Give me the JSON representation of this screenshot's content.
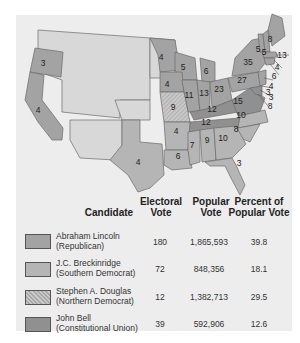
{
  "map": {
    "colors": {
      "lincoln": "#a3a3a3",
      "breckinridge": "#b5b5b5",
      "douglas": "#c2c2c2",
      "bell": "#8f8f8f",
      "territory": "#d8d8d8",
      "water": "#ededed"
    },
    "state_labels": [
      {
        "state": "Oregon",
        "votes": "3"
      },
      {
        "state": "California",
        "votes": "4"
      },
      {
        "state": "Texas",
        "votes": "4"
      },
      {
        "state": "Minnesota",
        "votes": "4"
      },
      {
        "state": "Wisconsin",
        "votes": "5"
      },
      {
        "state": "Michigan",
        "votes": "6"
      },
      {
        "state": "Iowa",
        "votes": "4"
      },
      {
        "state": "Illinois",
        "votes": "11"
      },
      {
        "state": "Indiana",
        "votes": "13"
      },
      {
        "state": "Ohio",
        "votes": "23"
      },
      {
        "state": "Missouri",
        "votes": "9"
      },
      {
        "state": "Kentucky",
        "votes": "12"
      },
      {
        "state": "Tennessee",
        "votes": "12"
      },
      {
        "state": "Virginia",
        "votes": "15"
      },
      {
        "state": "North Carolina",
        "votes": "10"
      },
      {
        "state": "South Carolina",
        "votes": "8"
      },
      {
        "state": "Arkansas",
        "votes": "4"
      },
      {
        "state": "Louisiana",
        "votes": "6"
      },
      {
        "state": "Mississippi",
        "votes": "7"
      },
      {
        "state": "Alabama",
        "votes": "9"
      },
      {
        "state": "Georgia",
        "votes": "10"
      },
      {
        "state": "Florida",
        "votes": "3"
      },
      {
        "state": "Pennsylvania",
        "votes": "27"
      },
      {
        "state": "New York",
        "votes": "35"
      },
      {
        "state": "Vermont",
        "votes": "5"
      },
      {
        "state": "New Hampshire",
        "votes": "5"
      },
      {
        "state": "Maine",
        "votes": "8"
      },
      {
        "state": "Massachusetts",
        "votes": "13"
      },
      {
        "state": "Rhode Island",
        "votes": "4"
      },
      {
        "state": "Connecticut",
        "votes": "6"
      },
      {
        "state": "New Jersey",
        "votes": "4"
      },
      {
        "state": "Delaware",
        "votes": "3"
      },
      {
        "state": "Maryland",
        "votes": "3"
      },
      {
        "state": "Maryland-2",
        "votes": "8"
      }
    ]
  },
  "legend": {
    "headers": {
      "candidate": "Candidate",
      "electoral_1": "Electoral",
      "electoral_2": "Vote",
      "popular_1": "Popular",
      "popular_2": "Vote",
      "percent_1": "Percent of",
      "percent_2": "Popular Vote"
    },
    "rows": [
      {
        "name": "Abraham Lincoln",
        "party": "(Republican)",
        "electoral": "180",
        "popular": "1,865,593",
        "percent": "39.8",
        "color": "#a3a3a3"
      },
      {
        "name": "J.C. Breckinridge",
        "party": "(Southern Democrat)",
        "electoral": "72",
        "popular": "848,356",
        "percent": "18.1",
        "color": "#b5b5b5"
      },
      {
        "name": "Stephen A. Douglas",
        "party": "(Northern Democrat)",
        "electoral": "12",
        "popular": "1,382,713",
        "percent": "29.5",
        "color": "#c4c4c4"
      },
      {
        "name": "John Bell",
        "party": "(Constitutional Union)",
        "electoral": "39",
        "popular": "592,906",
        "percent": "12.6",
        "color": "#909090"
      }
    ]
  }
}
